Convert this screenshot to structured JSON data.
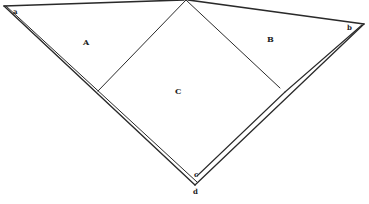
{
  "diagram": {
    "type": "geometric-figure",
    "stroke_color": "#2a2a2a",
    "background": "#ffffff",
    "regions": {
      "A": "A",
      "B": "B",
      "C": "C"
    },
    "points": {
      "a": "a",
      "b": "b",
      "c": "c",
      "d": "d"
    },
    "label_positions": {
      "a": [
        15,
        13
      ],
      "b": [
        348,
        30
      ],
      "A": [
        83,
        44
      ],
      "B": [
        267,
        42
      ],
      "C": [
        178,
        93
      ],
      "c": [
        196,
        179
      ],
      "d": [
        195,
        194
      ]
    }
  }
}
